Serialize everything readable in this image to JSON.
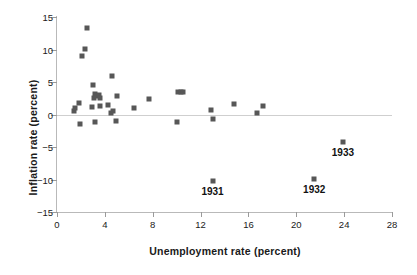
{
  "chart_data": {
    "type": "scatter",
    "title": "",
    "xlabel": "Unemployment rate (percent)",
    "ylabel": "Inflation rate (percent)",
    "xlim": [
      0,
      28
    ],
    "ylim": [
      -15,
      15
    ],
    "xticks": [
      0,
      4,
      8,
      12,
      16,
      20,
      24,
      28
    ],
    "yticks": [
      15,
      10,
      5,
      0,
      -5,
      -10,
      -15
    ],
    "xtick_labels": [
      "0",
      "4",
      "8",
      "12",
      "16",
      "20",
      "24",
      "28"
    ],
    "ytick_labels": [
      "15",
      "10",
      "5",
      "0",
      "−5",
      "−10",
      "−15"
    ],
    "grid": false,
    "legend": null,
    "reference_line": {
      "axis": "y",
      "value": 0,
      "color": "#cfcfcf"
    },
    "marker": {
      "shape": "square",
      "color": "#575757",
      "size": 5
    },
    "points": [
      {
        "x": 1.4,
        "y": 0.6
      },
      {
        "x": 1.5,
        "y": 1.0
      },
      {
        "x": 1.8,
        "y": 1.8
      },
      {
        "x": 1.9,
        "y": -1.5
      },
      {
        "x": 2.1,
        "y": 9.0
      },
      {
        "x": 2.3,
        "y": 10.1
      },
      {
        "x": 2.5,
        "y": 13.3
      },
      {
        "x": 2.9,
        "y": 1.2
      },
      {
        "x": 3.0,
        "y": 4.6
      },
      {
        "x": 3.1,
        "y": 2.6
      },
      {
        "x": 3.2,
        "y": 3.1
      },
      {
        "x": 3.2,
        "y": -1.1
      },
      {
        "x": 3.3,
        "y": 2.9
      },
      {
        "x": 3.5,
        "y": 3.0
      },
      {
        "x": 3.6,
        "y": 2.5
      },
      {
        "x": 3.6,
        "y": 1.3
      },
      {
        "x": 4.3,
        "y": 1.5
      },
      {
        "x": 4.5,
        "y": 0.2
      },
      {
        "x": 4.6,
        "y": 6.0
      },
      {
        "x": 4.7,
        "y": 0.5
      },
      {
        "x": 4.9,
        "y": -1.0
      },
      {
        "x": 5.0,
        "y": 2.9
      },
      {
        "x": 6.4,
        "y": 1.0
      },
      {
        "x": 7.7,
        "y": 2.4
      },
      {
        "x": 10.0,
        "y": -1.1
      },
      {
        "x": 10.1,
        "y": 3.5
      },
      {
        "x": 10.4,
        "y": 3.4
      },
      {
        "x": 10.5,
        "y": 3.4
      },
      {
        "x": 12.9,
        "y": 0.7
      },
      {
        "x": 13.0,
        "y": -0.7
      },
      {
        "x": 13.0,
        "y": -10.2,
        "label": "1931"
      },
      {
        "x": 14.8,
        "y": 1.6
      },
      {
        "x": 16.7,
        "y": 0.3
      },
      {
        "x": 17.2,
        "y": 1.3
      },
      {
        "x": 21.5,
        "y": -9.9,
        "label": "1932"
      },
      {
        "x": 23.9,
        "y": -4.3,
        "label": "1933"
      }
    ],
    "annotations": [
      {
        "text": "1931",
        "x": 13.0,
        "y": -10.2
      },
      {
        "text": "1932",
        "x": 21.5,
        "y": -9.9
      },
      {
        "text": "1933",
        "x": 23.9,
        "y": -4.3
      }
    ]
  }
}
